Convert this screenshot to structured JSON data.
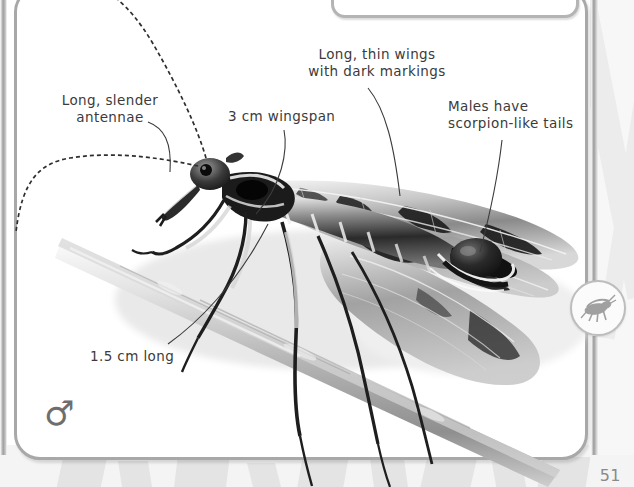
{
  "page": {
    "number": "51",
    "sex_symbol": "♂",
    "background_color": "#ffffff",
    "card_border_color": "#a8a8a8",
    "text_color": "#3b3b3b"
  },
  "badge": {
    "name": "insect-silhouette-badge",
    "icon": "cricket-icon",
    "border_color": "#bdbdbd"
  },
  "top_box": {
    "name": "cut-off-caption-box"
  },
  "photo": {
    "subject": "scorpionfly",
    "alt": "Black and white photograph of a male scorpionfly perched on a twig",
    "perch": "twig"
  },
  "annotations": [
    {
      "id": "antennae",
      "text": "Long, slender\nantennae",
      "target": "antenna"
    },
    {
      "id": "wingspan",
      "text": "3 cm wingspan",
      "target": "wing-base"
    },
    {
      "id": "wings",
      "text": "Long, thin wings\nwith dark markings",
      "target": "wing-markings"
    },
    {
      "id": "tails",
      "text": "Males have\nscorpion-like tails",
      "target": "tail-bulb"
    },
    {
      "id": "length",
      "text": "1.5 cm long",
      "target": "body-length"
    }
  ]
}
